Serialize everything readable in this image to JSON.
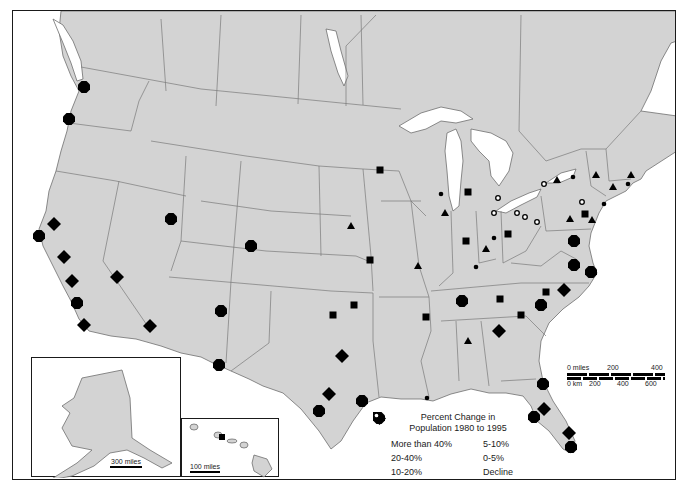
{
  "figure": {
    "type": "thematic-map",
    "region": "United States (with southern Canada)",
    "background_color": "#ffffff",
    "land_color": "#d3d3d3",
    "marker_color": "#000000"
  },
  "legend": {
    "title_line1": "Percent Change in",
    "title_line2": "Population 1980 to 1995",
    "items": [
      {
        "symbol": "diamond",
        "label": "More than 40%"
      },
      {
        "symbol": "octagon",
        "label": "20-40%"
      },
      {
        "symbol": "square",
        "label": "10-20%"
      },
      {
        "symbol": "triangle",
        "label": "5-10%"
      },
      {
        "symbol": "small-dot",
        "label": "0-5%"
      },
      {
        "symbol": "open-circle",
        "label": "Decline"
      }
    ]
  },
  "scalebar": {
    "miles_label": "0 miles",
    "miles_ticks": [
      "200",
      "400"
    ],
    "km_label": "0 km",
    "km_ticks": [
      "200",
      "400",
      "600"
    ]
  },
  "insets": {
    "alaska": {
      "name": "Alaska",
      "scale_label": "300 miles"
    },
    "hawaii": {
      "name": "Hawaii",
      "scale_label": "100 miles"
    }
  },
  "markers": [
    {
      "cat": "octagon",
      "x": 83,
      "y": 86,
      "place": "Seattle"
    },
    {
      "cat": "octagon",
      "x": 68,
      "y": 118,
      "place": "Portland"
    },
    {
      "cat": "diamond",
      "x": 53,
      "y": 223,
      "place": "Sacramento"
    },
    {
      "cat": "octagon",
      "x": 38,
      "y": 235,
      "place": "San Francisco"
    },
    {
      "cat": "diamond",
      "x": 63,
      "y": 256,
      "place": "San Jose / Fresno"
    },
    {
      "cat": "diamond",
      "x": 71,
      "y": 280,
      "place": "Bakersfield"
    },
    {
      "cat": "octagon",
      "x": 76,
      "y": 302,
      "place": "Los Angeles"
    },
    {
      "cat": "diamond",
      "x": 83,
      "y": 324,
      "place": "San Diego"
    },
    {
      "cat": "diamond",
      "x": 116,
      "y": 276,
      "place": "Las Vegas"
    },
    {
      "cat": "octagon",
      "x": 170,
      "y": 218,
      "place": "Salt Lake City"
    },
    {
      "cat": "octagon",
      "x": 250,
      "y": 245,
      "place": "Denver"
    },
    {
      "cat": "diamond",
      "x": 149,
      "y": 325,
      "place": "Phoenix"
    },
    {
      "cat": "octagon",
      "x": 220,
      "y": 310,
      "place": "Albuquerque"
    },
    {
      "cat": "octagon",
      "x": 218,
      "y": 364,
      "place": "El Paso"
    },
    {
      "cat": "diamond",
      "x": 341,
      "y": 355,
      "place": "Dallas"
    },
    {
      "cat": "diamond",
      "x": 328,
      "y": 393,
      "place": "Austin"
    },
    {
      "cat": "octagon",
      "x": 318,
      "y": 410,
      "place": "San Antonio"
    },
    {
      "cat": "octagon",
      "x": 361,
      "y": 400,
      "place": "Houston"
    },
    {
      "cat": "small-dot",
      "x": 426,
      "y": 397,
      "place": "New Orleans"
    },
    {
      "cat": "square",
      "x": 379,
      "y": 169,
      "place": "Minneapolis"
    },
    {
      "cat": "triangle",
      "x": 350,
      "y": 225,
      "place": "Omaha"
    },
    {
      "cat": "square",
      "x": 369,
      "y": 259,
      "place": "Kansas City"
    },
    {
      "cat": "triangle",
      "x": 417,
      "y": 265,
      "place": "St. Louis"
    },
    {
      "cat": "square",
      "x": 353,
      "y": 304,
      "place": "Tulsa"
    },
    {
      "cat": "square",
      "x": 332,
      "y": 314,
      "place": "Oklahoma City"
    },
    {
      "cat": "square",
      "x": 425,
      "y": 316,
      "place": "Memphis"
    },
    {
      "cat": "small-dot",
      "x": 440,
      "y": 193,
      "place": "Milwaukee"
    },
    {
      "cat": "triangle",
      "x": 444,
      "y": 212,
      "place": "Chicago"
    },
    {
      "cat": "square",
      "x": 467,
      "y": 191,
      "place": "Grand Rapids"
    },
    {
      "cat": "open-circle",
      "x": 497,
      "y": 197,
      "place": "Flint"
    },
    {
      "cat": "open-circle",
      "x": 493,
      "y": 212,
      "place": "Toledo"
    },
    {
      "cat": "open-circle",
      "x": 516,
      "y": 212,
      "place": "Cleveland"
    },
    {
      "cat": "open-circle",
      "x": 524,
      "y": 216,
      "place": "Youngstown"
    },
    {
      "cat": "open-circle",
      "x": 536,
      "y": 221,
      "place": "Pittsburgh"
    },
    {
      "cat": "square",
      "x": 465,
      "y": 240,
      "place": "Indianapolis"
    },
    {
      "cat": "small-dot",
      "x": 493,
      "y": 237,
      "place": "Dayton"
    },
    {
      "cat": "square",
      "x": 507,
      "y": 233,
      "place": "Columbus"
    },
    {
      "cat": "triangle",
      "x": 485,
      "y": 248,
      "place": "Cincinnati"
    },
    {
      "cat": "small-dot",
      "x": 475,
      "y": 266,
      "place": "Louisville"
    },
    {
      "cat": "octagon",
      "x": 461,
      "y": 300,
      "place": "Nashville"
    },
    {
      "cat": "square",
      "x": 499,
      "y": 298,
      "place": "Knoxville"
    },
    {
      "cat": "square",
      "x": 425,
      "y": 316,
      "place": "Memphis (2)"
    },
    {
      "cat": "diamond",
      "x": 498,
      "y": 330,
      "place": "Atlanta"
    },
    {
      "cat": "triangle",
      "x": 467,
      "y": 340,
      "place": "Birmingham"
    },
    {
      "cat": "square",
      "x": 520,
      "y": 314,
      "place": "Greenville"
    },
    {
      "cat": "octagon",
      "x": 540,
      "y": 304,
      "place": "Charlotte"
    },
    {
      "cat": "square",
      "x": 545,
      "y": 291,
      "place": "Greensboro"
    },
    {
      "cat": "diamond",
      "x": 563,
      "y": 289,
      "place": "Raleigh"
    },
    {
      "cat": "octagon",
      "x": 573,
      "y": 240,
      "place": "Washington DC"
    },
    {
      "cat": "octagon",
      "x": 573,
      "y": 264,
      "place": "Richmond"
    },
    {
      "cat": "octagon",
      "x": 590,
      "y": 271,
      "place": "Norfolk"
    },
    {
      "cat": "open-circle",
      "x": 543,
      "y": 183,
      "place": "Buffalo"
    },
    {
      "cat": "triangle",
      "x": 556,
      "y": 179,
      "place": "Rochester"
    },
    {
      "cat": "small-dot",
      "x": 572,
      "y": 176,
      "place": "Syracuse"
    },
    {
      "cat": "triangle",
      "x": 595,
      "y": 174,
      "place": "Albany"
    },
    {
      "cat": "open-circle",
      "x": 581,
      "y": 201,
      "place": "Scranton"
    },
    {
      "cat": "square",
      "x": 584,
      "y": 213,
      "place": "Allentown"
    },
    {
      "cat": "triangle",
      "x": 569,
      "y": 218,
      "place": "Harrisburg"
    },
    {
      "cat": "triangle",
      "x": 591,
      "y": 219,
      "place": "Philadelphia"
    },
    {
      "cat": "small-dot",
      "x": 603,
      "y": 203,
      "place": "New York"
    },
    {
      "cat": "triangle",
      "x": 612,
      "y": 186,
      "place": "Hartford"
    },
    {
      "cat": "small-dot",
      "x": 627,
      "y": 183,
      "place": "Providence"
    },
    {
      "cat": "triangle",
      "x": 630,
      "y": 174,
      "place": "Boston"
    },
    {
      "cat": "octagon",
      "x": 542,
      "y": 383,
      "place": "Jacksonville"
    },
    {
      "cat": "diamond",
      "x": 543,
      "y": 408,
      "place": "Orlando"
    },
    {
      "cat": "octagon",
      "x": 533,
      "y": 416,
      "place": "Tampa"
    },
    {
      "cat": "diamond",
      "x": 568,
      "y": 432,
      "place": "West Palm Beach"
    },
    {
      "cat": "octagon",
      "x": 570,
      "y": 446,
      "place": "Miami"
    },
    {
      "cat": "square",
      "x": 222,
      "y": 436,
      "place": "Honolulu"
    }
  ]
}
